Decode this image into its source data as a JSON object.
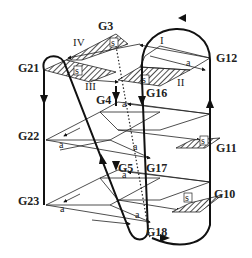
{
  "diagram": {
    "nodes": {
      "G3": "G3",
      "G4": "G4",
      "G5": "G5",
      "G10": "G10",
      "G11": "G11",
      "G12": "G12",
      "G16": "G16",
      "G17": "G17",
      "G18": "G18",
      "G21": "G21",
      "G22": "G22",
      "G23": "G23"
    },
    "quadrants": {
      "I": "I",
      "II": "II",
      "III": "III",
      "IV": "IV"
    },
    "marks": {
      "s": "s",
      "a": "a"
    }
  }
}
